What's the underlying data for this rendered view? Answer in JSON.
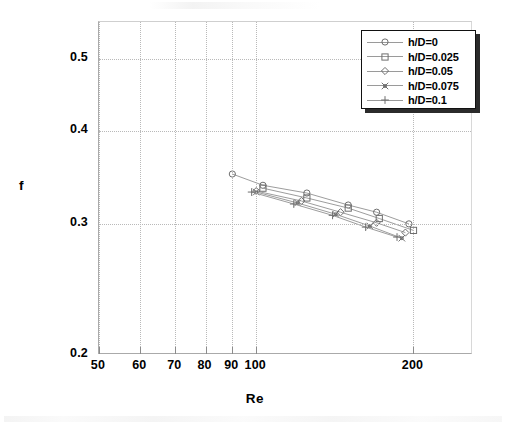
{
  "chart_data": {
    "type": "line",
    "title": "",
    "xlabel": "Re",
    "ylabel": "f",
    "xscale": "log",
    "yscale": "log",
    "xlim": [
      50,
      260
    ],
    "ylim": [
      0.2,
      0.56
    ],
    "xticks": [
      50,
      60,
      70,
      80,
      90,
      100,
      200
    ],
    "xtick_labels": [
      "50",
      "60",
      "70",
      "80",
      "90",
      "100",
      "200"
    ],
    "yticks": [
      0.2,
      0.3,
      0.4,
      0.5
    ],
    "ytick_labels": [
      "0.2",
      "0.3",
      "0.4",
      "0.5"
    ],
    "grid": true,
    "legend_position": "top-right",
    "series": [
      {
        "name": "h/D=0",
        "marker": "circle",
        "x": [
          90,
          103,
          125,
          150,
          170,
          196
        ],
        "y": [
          0.35,
          0.338,
          0.33,
          0.318,
          0.311,
          0.3
        ]
      },
      {
        "name": "h/D=0.025",
        "marker": "square",
        "x": [
          103,
          125,
          150,
          172,
          200
        ],
        "y": [
          0.335,
          0.325,
          0.315,
          0.305,
          0.294
        ]
      },
      {
        "name": "h/D=0.05",
        "marker": "diamond",
        "x": [
          100,
          122,
          145,
          170,
          193
        ],
        "y": [
          0.332,
          0.322,
          0.311,
          0.301,
          0.292
        ]
      },
      {
        "name": "h/D=0.075",
        "marker": "cross-x",
        "x": [
          100,
          120,
          142,
          165,
          190
        ],
        "y": [
          0.331,
          0.32,
          0.309,
          0.298,
          0.287
        ]
      },
      {
        "name": "h/D=0.1",
        "marker": "plus",
        "x": [
          98,
          118,
          140,
          162,
          186
        ],
        "y": [
          0.331,
          0.319,
          0.308,
          0.297,
          0.288
        ]
      }
    ]
  },
  "axes": {
    "ylabel": "f",
    "xlabel": "Re"
  },
  "legend": {
    "items": [
      {
        "label": "h/D=0",
        "marker": "circle"
      },
      {
        "label": "h/D=0.025",
        "marker": "square"
      },
      {
        "label": "h/D=0.05",
        "marker": "diamond"
      },
      {
        "label": "h/D=0.075",
        "marker": "cross-x"
      },
      {
        "label": "h/D=0.1",
        "marker": "plus"
      }
    ]
  },
  "ticks": {
    "x": [
      "50",
      "60",
      "70",
      "80",
      "90",
      "100",
      "200"
    ],
    "y": [
      "0.5",
      "0.4",
      "0.3",
      "0.2"
    ]
  }
}
